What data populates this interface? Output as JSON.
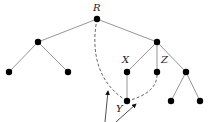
{
  "diagram": {
    "type": "tree",
    "labels": {
      "root": "R",
      "x": "X",
      "z": "Z",
      "y": "Y"
    },
    "nodes": [
      {
        "id": "R",
        "x": 97,
        "y": 19
      },
      {
        "id": "L",
        "x": 38,
        "y": 42
      },
      {
        "id": "RC",
        "x": 157,
        "y": 42
      },
      {
        "id": "LL",
        "x": 9,
        "y": 72
      },
      {
        "id": "LR",
        "x": 68,
        "y": 72
      },
      {
        "id": "X",
        "x": 127,
        "y": 72
      },
      {
        "id": "Z",
        "x": 157,
        "y": 72
      },
      {
        "id": "RR",
        "x": 186,
        "y": 72
      },
      {
        "id": "Y",
        "x": 127,
        "y": 101
      },
      {
        "id": "RRL",
        "x": 171,
        "y": 101
      },
      {
        "id": "RRR",
        "x": 200,
        "y": 101
      }
    ],
    "edges": [
      [
        "R",
        "L"
      ],
      [
        "R",
        "RC"
      ],
      [
        "L",
        "LL"
      ],
      [
        "L",
        "LR"
      ],
      [
        "RC",
        "X"
      ],
      [
        "RC",
        "Z"
      ],
      [
        "RC",
        "RR"
      ],
      [
        "X",
        "Y"
      ],
      [
        "RR",
        "RRL"
      ],
      [
        "RR",
        "RRR"
      ]
    ],
    "dashed_paths": [
      [
        "R",
        "Y"
      ],
      [
        "Y",
        "Z"
      ]
    ],
    "arrows": 2
  }
}
